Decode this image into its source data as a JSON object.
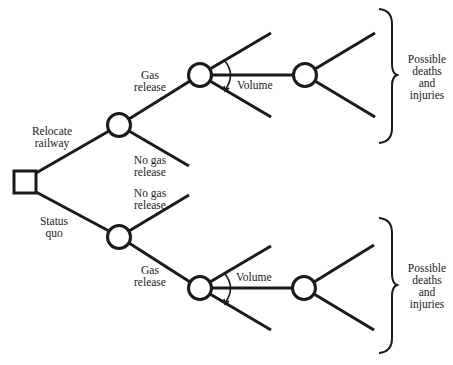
{
  "diagram": {
    "type": "decision-tree",
    "decision_node": {
      "shape": "square",
      "label": ""
    },
    "branches": {
      "relocate": {
        "label_line1": "Relocate",
        "label_line2": "railway",
        "gas_release": {
          "line1": "Gas",
          "line2": "release"
        },
        "no_gas_release": {
          "line1": "No gas",
          "line2": "release"
        },
        "volume_label": "Volume",
        "outcome": {
          "line1": "Possible",
          "line2": "deaths",
          "line3": "and",
          "line4": "injuries"
        }
      },
      "status_quo": {
        "label_line1": "Status",
        "label_line2": "quo",
        "gas_release": {
          "line1": "Gas",
          "line2": "release"
        },
        "no_gas_release": {
          "line1": "No gas",
          "line2": "release"
        },
        "volume_label": "Volume",
        "outcome": {
          "line1": "Possible",
          "line2": "deaths",
          "line3": "and",
          "line4": "injuries"
        }
      }
    },
    "colors": {
      "line": "#1a1a1a",
      "background": "#ffffff",
      "text": "#222222"
    }
  }
}
